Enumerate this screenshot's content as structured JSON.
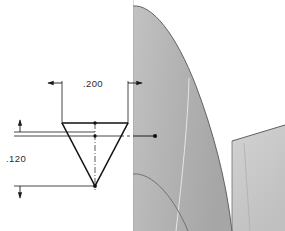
{
  "drawing": {
    "type": "engineering-detail-drawing",
    "background_color": "#ffffff",
    "line_color": "#1a1a1a",
    "dimensions": [
      {
        "id": "width",
        "label": ".200",
        "orientation": "horizontal",
        "position": "above-part",
        "arrows": "outward",
        "text_x": 93,
        "text_y": 88
      },
      {
        "id": "depth",
        "label": ".120",
        "orientation": "vertical",
        "position": "left-of-part",
        "arrows": "outward",
        "text_x": 22,
        "text_y": 158
      }
    ],
    "part": {
      "name": "v-notch-profile",
      "shape": "inverted-triangle",
      "top_left_x": 62,
      "top_right_x": 128,
      "top_y": 123,
      "apex_x": 95,
      "apex_y": 186,
      "centerline": "vertical-dash-dot",
      "vertex_dots": 3
    },
    "leader": {
      "name": "section-leader-line",
      "from_x": 128,
      "from_y": 136,
      "to_x": 155,
      "to_y": 136,
      "terminator": "dot"
    },
    "model_view": {
      "name": "shaded-3d-blade-model",
      "left_edge_x": 133,
      "right_edge_x": 285,
      "top_y": 0,
      "bottom_y": 231,
      "colors": {
        "blade_face": "#b6b6b6",
        "blade_face_dark": "#ababab",
        "platform": "#c9c9c9",
        "platform_shadow": "#bdbdbd",
        "edge_line": "#5a5a5a",
        "highlight_line": "#e8e8e8"
      }
    }
  }
}
